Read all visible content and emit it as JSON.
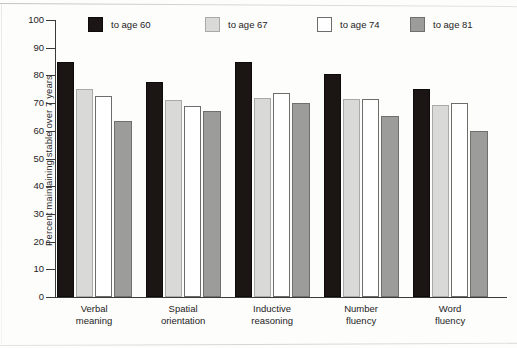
{
  "chart_data": {
    "type": "bar",
    "title": "",
    "xlabel": "",
    "ylabel": "Percent maintaining stable over 7 years",
    "ylim": [
      0,
      100
    ],
    "yticks": [
      0,
      10,
      20,
      30,
      40,
      50,
      60,
      70,
      80,
      90,
      100
    ],
    "grid": false,
    "legend_position": "top",
    "categories": [
      "Verbal meaning",
      "Spatial orientation",
      "Inductive reasoning",
      "Number fluency",
      "Word fluency"
    ],
    "category_lines": [
      [
        "Verbal",
        "meaning"
      ],
      [
        "Spatial",
        "orientation"
      ],
      [
        "Inductive",
        "reasoning"
      ],
      [
        "Number",
        "fluency"
      ],
      [
        "Word",
        "fluency"
      ]
    ],
    "series": [
      {
        "name": "to age 60",
        "color": "#1b1614",
        "values": [
          85,
          77.5,
          85,
          80.5,
          75
        ]
      },
      {
        "name": "to age 67",
        "color": "#d9d9d7",
        "values": [
          75,
          71,
          72,
          71.5,
          69.5
        ]
      },
      {
        "name": "to age 74",
        "color": "#ffffff",
        "values": [
          72.5,
          69,
          73.5,
          71.5,
          70
        ]
      },
      {
        "name": "to age 81",
        "color": "#9c9c9a",
        "values": [
          63.5,
          67,
          70,
          65.5,
          60
        ]
      }
    ]
  },
  "legend": {
    "items": [
      {
        "label": "to age 60",
        "swatch": "black"
      },
      {
        "label": "to age 67",
        "swatch": "light-gray"
      },
      {
        "label": "to age 74",
        "swatch": "white"
      },
      {
        "label": "to age 81",
        "swatch": "medium-gray"
      }
    ]
  },
  "axis": {
    "y_title": "Percent maintaining stable over 7 years",
    "tick_labels": [
      "100",
      "90",
      "80",
      "70",
      "60",
      "50",
      "40",
      "30",
      "20",
      "10",
      "0"
    ]
  }
}
